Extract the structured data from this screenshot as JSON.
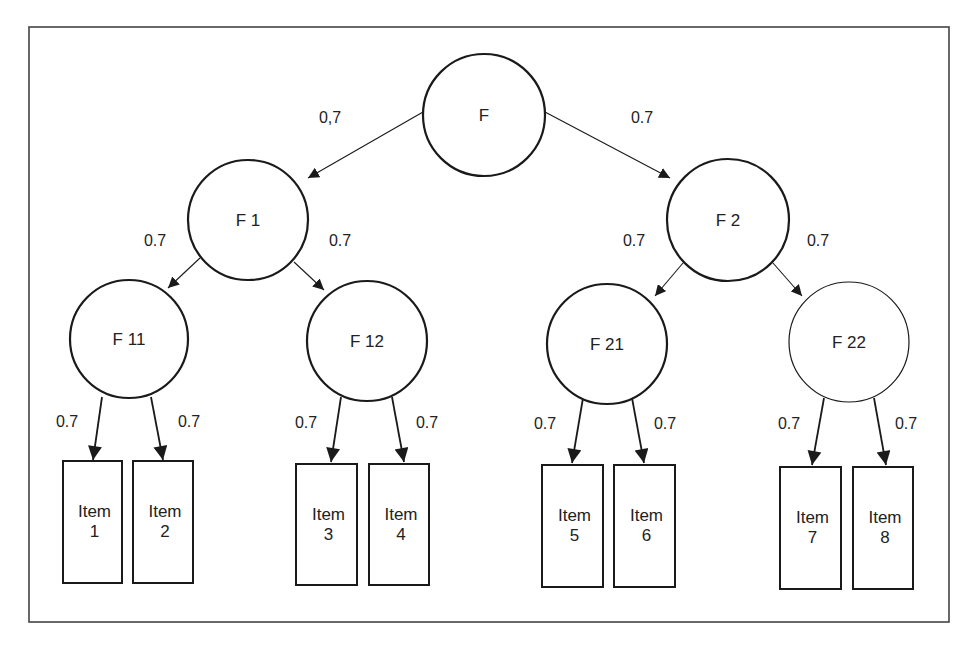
{
  "diagram": {
    "type": "hierarchical factor model",
    "colors": {
      "stroke": "#1a1a1a",
      "text": "#222222",
      "background": "#ffffff",
      "frame": "#444444"
    },
    "frame": {
      "x": 29,
      "y": 27,
      "w": 920,
      "h": 595
    },
    "nodes": [
      {
        "id": "F",
        "label": "F",
        "cx": 484,
        "cy": 115,
        "r": 61,
        "stroke_width": 2.2
      },
      {
        "id": "F1",
        "label": "F 1",
        "cx": 248,
        "cy": 220,
        "r": 60,
        "stroke_width": 2.2
      },
      {
        "id": "F2",
        "label": "F 2",
        "cx": 728,
        "cy": 220,
        "r": 61,
        "stroke_width": 2.2
      },
      {
        "id": "F11",
        "label": "F 11",
        "cx": 129,
        "cy": 339,
        "r": 59,
        "stroke_width": 2.2
      },
      {
        "id": "F12",
        "label": "F 12",
        "cx": 367,
        "cy": 341,
        "r": 60,
        "stroke_width": 2.2
      },
      {
        "id": "F21",
        "label": "F 21",
        "cx": 607,
        "cy": 344,
        "r": 60,
        "stroke_width": 2.2
      },
      {
        "id": "F22",
        "label": "F 22",
        "cx": 849,
        "cy": 342,
        "r": 60,
        "stroke_width": 1.2
      }
    ],
    "leaves": [
      {
        "id": "I1",
        "line1": "Item",
        "line2": "1",
        "x": 63,
        "y": 461,
        "w": 59,
        "h": 122
      },
      {
        "id": "I2",
        "line1": "Item",
        "line2": "2",
        "x": 133,
        "y": 461,
        "w": 60,
        "h": 122
      },
      {
        "id": "I3",
        "line1": "Item",
        "line2": "3",
        "x": 296,
        "y": 464,
        "w": 61,
        "h": 121
      },
      {
        "id": "I4",
        "line1": "Item",
        "line2": "4",
        "x": 369,
        "y": 464,
        "w": 60,
        "h": 121
      },
      {
        "id": "I5",
        "line1": "Item",
        "line2": "5",
        "x": 542,
        "y": 465,
        "w": 61,
        "h": 122
      },
      {
        "id": "I6",
        "line1": "Item",
        "line2": "6",
        "x": 614,
        "y": 465,
        "w": 61,
        "h": 122
      },
      {
        "id": "I7",
        "line1": "Item",
        "line2": "7",
        "x": 780,
        "y": 467,
        "w": 61,
        "h": 122
      },
      {
        "id": "I8",
        "line1": "Item",
        "line2": "8",
        "x": 853,
        "y": 467,
        "w": 60,
        "h": 122
      }
    ],
    "edges": [
      {
        "from": "F",
        "to": "F1",
        "x1": 423,
        "y1": 112,
        "x2": 308,
        "y2": 178,
        "label": "0,7",
        "lx": 330,
        "ly": 123,
        "width": 1.1,
        "head": "small"
      },
      {
        "from": "F",
        "to": "F2",
        "x1": 545,
        "y1": 112,
        "x2": 670,
        "y2": 178,
        "label": "0.7",
        "lx": 642,
        "ly": 123,
        "width": 1.1,
        "head": "small"
      },
      {
        "from": "F1",
        "to": "F11",
        "x1": 200,
        "y1": 258,
        "x2": 168,
        "y2": 288,
        "label": "0.7",
        "lx": 155,
        "ly": 246,
        "width": 1.1,
        "head": "small"
      },
      {
        "from": "F1",
        "to": "F12",
        "x1": 294,
        "y1": 262,
        "x2": 324,
        "y2": 290,
        "label": "0.7",
        "lx": 340,
        "ly": 246,
        "width": 1.1,
        "head": "small"
      },
      {
        "from": "F2",
        "to": "F21",
        "x1": 683,
        "y1": 263,
        "x2": 655,
        "y2": 296,
        "label": "0.7",
        "lx": 634,
        "ly": 246,
        "width": 1.1,
        "head": "small"
      },
      {
        "from": "F2",
        "to": "F22",
        "x1": 773,
        "y1": 263,
        "x2": 802,
        "y2": 296,
        "label": "0.7",
        "lx": 818,
        "ly": 246,
        "width": 1.1,
        "head": "small"
      },
      {
        "from": "F11",
        "to": "I1",
        "x1": 102,
        "y1": 397,
        "x2": 93,
        "y2": 460,
        "label": "0.7",
        "lx": 67,
        "ly": 427,
        "width": 1.8,
        "head": "large"
      },
      {
        "from": "F11",
        "to": "I2",
        "x1": 151,
        "y1": 397,
        "x2": 163,
        "y2": 460,
        "label": "0.7",
        "lx": 189,
        "ly": 427,
        "width": 1.8,
        "head": "large"
      },
      {
        "from": "F12",
        "to": "I3",
        "x1": 341,
        "y1": 397,
        "x2": 331,
        "y2": 462,
        "label": "0.7",
        "lx": 306,
        "ly": 428,
        "width": 1.8,
        "head": "large"
      },
      {
        "from": "F12",
        "to": "I4",
        "x1": 392,
        "y1": 397,
        "x2": 404,
        "y2": 462,
        "label": "0.7",
        "lx": 427,
        "ly": 428,
        "width": 1.8,
        "head": "large"
      },
      {
        "from": "F21",
        "to": "I5",
        "x1": 583,
        "y1": 398,
        "x2": 572,
        "y2": 463,
        "label": "0.7",
        "lx": 545,
        "ly": 429,
        "width": 1.8,
        "head": "large"
      },
      {
        "from": "F21",
        "to": "I6",
        "x1": 632,
        "y1": 398,
        "x2": 644,
        "y2": 463,
        "label": "0.7",
        "lx": 665,
        "ly": 429,
        "width": 1.8,
        "head": "large"
      },
      {
        "from": "F22",
        "to": "I7",
        "x1": 824,
        "y1": 398,
        "x2": 812,
        "y2": 465,
        "label": "0.7",
        "lx": 789,
        "ly": 429,
        "width": 1.8,
        "head": "large"
      },
      {
        "from": "F22",
        "to": "I8",
        "x1": 874,
        "y1": 398,
        "x2": 886,
        "y2": 465,
        "label": "0.7",
        "lx": 906,
        "ly": 429,
        "width": 1.8,
        "head": "large"
      }
    ]
  }
}
